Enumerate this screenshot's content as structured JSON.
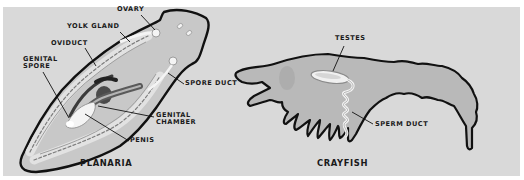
{
  "figure": {
    "background_color": "#d9d9d9",
    "border_color": "#ffffff"
  },
  "planaria": {
    "title": "PLANARIA",
    "labels": {
      "ovary": "OVARY",
      "yolk_gland": "YOLK GLAND",
      "oviduct": "OVIDUCT",
      "genital_spore_line1": "GENITAL",
      "genital_spore_line2": "SPORE",
      "spore_duct": "SPORE DUCT",
      "genital_chamber_line1": "GENITAL",
      "genital_chamber_line2": "CHAMBER",
      "penis": "PENIS"
    }
  },
  "crayfish": {
    "title": "CRAYFISH",
    "labels": {
      "testes": "TESTES",
      "sperm_duct": "SPERM DUCT"
    }
  }
}
